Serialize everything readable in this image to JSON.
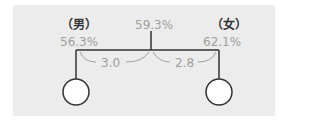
{
  "diagram": {
    "male": {
      "label": "（男）",
      "value": "56.3%"
    },
    "female": {
      "label": "（女）",
      "value": "62.1%"
    },
    "center": {
      "value": "59.3%"
    },
    "diff_left": "3.0",
    "diff_right": "2.8",
    "colors": {
      "background": "#ececec",
      "line": "#333333",
      "text_gray": "#a0a0a0",
      "arc": "#a0a0a0"
    }
  }
}
